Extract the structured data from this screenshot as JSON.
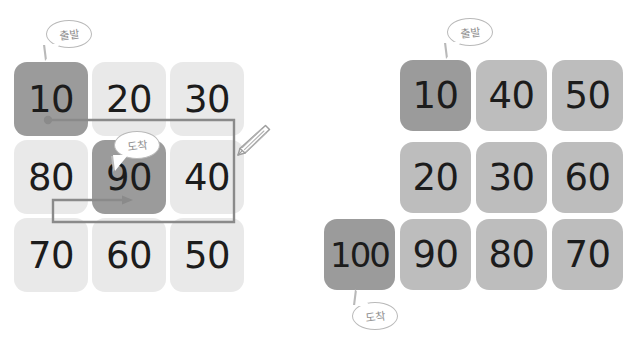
{
  "colors": {
    "background": "#ffffff",
    "cell_dark": "#9b9b9b",
    "cell_light": "#e9e9e9",
    "cell_mid": "#bdbdbd",
    "number_text": "#1c1c1c",
    "bubble_outline": "#b9b9b9",
    "bubble_text": "#8f8f8f",
    "path_line": "#8a8a8a",
    "pencil_outline": "#a0a0a0"
  },
  "labels": {
    "start": "출발",
    "end": "도착"
  },
  "left_diagram": {
    "name": "snake-order-grid",
    "rows": 3,
    "cols": 3,
    "cells": [
      {
        "value": "10",
        "row": 1,
        "col": 1,
        "tone": "dark",
        "highlight": true
      },
      {
        "value": "20",
        "row": 1,
        "col": 2,
        "tone": "light",
        "highlight": false
      },
      {
        "value": "30",
        "row": 1,
        "col": 3,
        "tone": "light",
        "highlight": false
      },
      {
        "value": "80",
        "row": 2,
        "col": 1,
        "tone": "light",
        "highlight": false
      },
      {
        "value": "90",
        "row": 2,
        "col": 2,
        "tone": "dark",
        "highlight": true
      },
      {
        "value": "40",
        "row": 2,
        "col": 3,
        "tone": "light",
        "highlight": false
      },
      {
        "value": "70",
        "row": 3,
        "col": 1,
        "tone": "light",
        "highlight": false
      },
      {
        "value": "60",
        "row": 3,
        "col": 2,
        "tone": "light",
        "highlight": false
      },
      {
        "value": "50",
        "row": 3,
        "col": 3,
        "tone": "light",
        "highlight": false
      }
    ],
    "start_cell": "10",
    "end_cell": "90",
    "path_description": "from 10 right past 30, down, left past 70, right into 90",
    "has_pencil_icon": true
  },
  "right_diagram": {
    "name": "staircase-order-grid",
    "rows": 3,
    "cols": 4,
    "cells": [
      {
        "value": "10",
        "row": 1,
        "col": 2,
        "tone": "dark",
        "highlight": true
      },
      {
        "value": "40",
        "row": 1,
        "col": 3,
        "tone": "mid",
        "highlight": false
      },
      {
        "value": "50",
        "row": 1,
        "col": 4,
        "tone": "mid",
        "highlight": false
      },
      {
        "value": "20",
        "row": 2,
        "col": 2,
        "tone": "mid",
        "highlight": false
      },
      {
        "value": "30",
        "row": 2,
        "col": 3,
        "tone": "mid",
        "highlight": false
      },
      {
        "value": "60",
        "row": 2,
        "col": 4,
        "tone": "mid",
        "highlight": false
      },
      {
        "value": "100",
        "row": 3,
        "col": 1,
        "tone": "dark",
        "highlight": true
      },
      {
        "value": "90",
        "row": 3,
        "col": 2,
        "tone": "mid",
        "highlight": false
      },
      {
        "value": "80",
        "row": 3,
        "col": 3,
        "tone": "mid",
        "highlight": false
      },
      {
        "value": "70",
        "row": 3,
        "col": 4,
        "tone": "mid",
        "highlight": false
      }
    ],
    "start_cell": "10",
    "end_cell": "100",
    "has_pencil_icon": false
  }
}
